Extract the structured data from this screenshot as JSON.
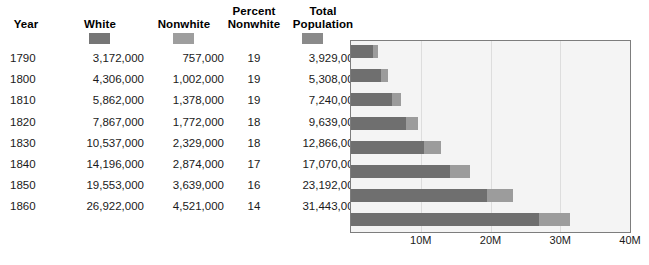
{
  "table": {
    "columns": [
      {
        "key": "year",
        "label": "Year"
      },
      {
        "key": "white",
        "label": "White"
      },
      {
        "key": "nonwhite",
        "label": "Nonwhite"
      },
      {
        "key": "percent_nonwhite",
        "label": "Percent\nNonwhite",
        "label_line1": "Percent",
        "label_line2": "Nonwhite"
      },
      {
        "key": "total",
        "label": "Total\nPopulation",
        "label_line1": "Total",
        "label_line2": "Population"
      }
    ],
    "legend_swatches": [
      {
        "name": "white-swatch",
        "color": "#767676"
      },
      {
        "name": "nonwhite-swatch",
        "color": "#9e9e9e"
      },
      {
        "name": "total-population-swatch",
        "color": "#8a8a8a"
      }
    ],
    "rows": [
      {
        "year": "1790",
        "white": "3,172,000",
        "nonwhite": "757,000",
        "percent_nonwhite": "19",
        "total": "3,929,000"
      },
      {
        "year": "1800",
        "white": "4,306,000",
        "nonwhite": "1,002,000",
        "percent_nonwhite": "19",
        "total": "5,308,000"
      },
      {
        "year": "1810",
        "white": "5,862,000",
        "nonwhite": "1,378,000",
        "percent_nonwhite": "19",
        "total": "7,240,000"
      },
      {
        "year": "1820",
        "white": "7,867,000",
        "nonwhite": "1,772,000",
        "percent_nonwhite": "18",
        "total": "9,639,000"
      },
      {
        "year": "1830",
        "white": "10,537,000",
        "nonwhite": "2,329,000",
        "percent_nonwhite": "18",
        "total": "12,866,000"
      },
      {
        "year": "1840",
        "white": "14,196,000",
        "nonwhite": "2,874,000",
        "percent_nonwhite": "17",
        "total": "17,070,000"
      },
      {
        "year": "1850",
        "white": "19,553,000",
        "nonwhite": "3,639,000",
        "percent_nonwhite": "16",
        "total": "23,192,000"
      },
      {
        "year": "1860",
        "white": "26,922,000",
        "nonwhite": "4,521,000",
        "percent_nonwhite": "14",
        "total": "31,443,000"
      }
    ]
  },
  "chart_data": {
    "type": "bar",
    "orientation": "horizontal",
    "stacked": true,
    "title": "",
    "xlabel": "",
    "ylabel": "",
    "categories": [
      "1790",
      "1800",
      "1810",
      "1820",
      "1830",
      "1840",
      "1850",
      "1860"
    ],
    "series": [
      {
        "name": "White",
        "color": "#6f6f6f",
        "values": [
          3172000,
          4306000,
          5862000,
          7867000,
          10537000,
          14196000,
          19553000,
          26922000
        ]
      },
      {
        "name": "Nonwhite",
        "color": "#9c9c9c",
        "values": [
          757000,
          1002000,
          1378000,
          1772000,
          2329000,
          2874000,
          3639000,
          4521000
        ]
      }
    ],
    "totals": [
      3929000,
      5308000,
      7240000,
      9639000,
      12866000,
      17070000,
      23192000,
      31443000
    ],
    "xlim": [
      0,
      40000000
    ],
    "xticks": [
      10000000,
      20000000,
      30000000,
      40000000
    ],
    "xtick_labels": [
      "10M",
      "20M",
      "30M",
      "40M"
    ],
    "grid": true,
    "gridlines_at": [
      10000000,
      20000000,
      30000000
    ],
    "legend_position": "table-header",
    "plot_background": "#f4f4f4",
    "plot_border_color": "#7d7d7d",
    "gridline_color": "#dddddd"
  }
}
